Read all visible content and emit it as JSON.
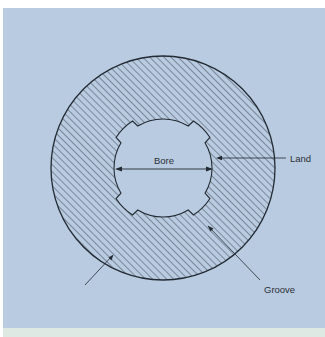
{
  "figure": {
    "type": "cross-section diagram of a rifled gun barrel",
    "colors": {
      "background": "#b9cbe0",
      "outline": "#222a33",
      "hatch": "#2c3440",
      "footer_strip": "#dfe9e4"
    },
    "labels": {
      "bore": "Bore",
      "land": "Land",
      "groove": "Groove",
      "barrel": "Barrel"
    }
  }
}
